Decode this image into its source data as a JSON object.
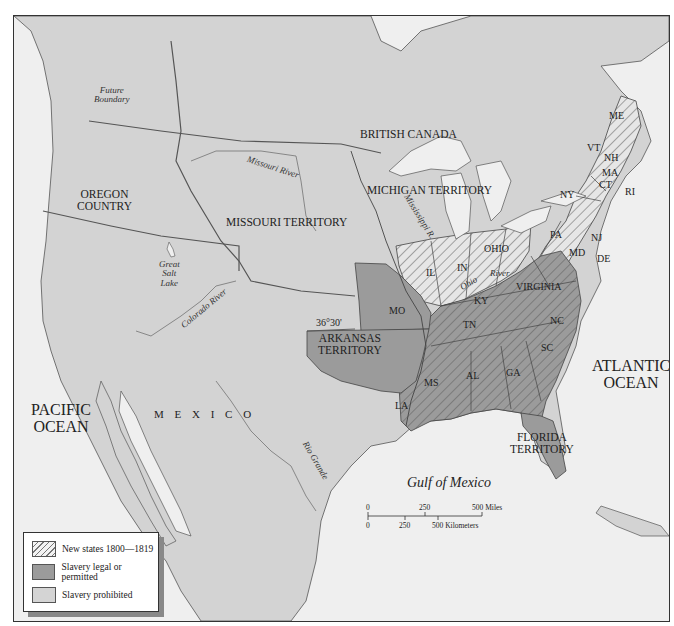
{
  "map": {
    "title": "",
    "colors": {
      "water": "#efefef",
      "land_other": "#d2d2d2",
      "slavery_prohibited": "#d4d4d4",
      "slavery_legal": "#9b9b9b",
      "hatch_line": "#777777",
      "border": "#333333"
    },
    "regions": {
      "british_canada": "BRITISH CANADA",
      "oregon_country": "OREGON COUNTRY",
      "oregon_line1": "OREGON",
      "oregon_line2": "COUNTRY",
      "missouri_territory": "MISSOURI TERRITORY",
      "michigan_territory": "MICHIGAN TERRITORY",
      "arkansas_line1": "ARKANSAS",
      "arkansas_line2": "TERRITORY",
      "florida_line1": "FLORIDA",
      "florida_line2": "TERRITORY",
      "mexico": "M E X I C O",
      "pacific_line1": "PACIFIC",
      "pacific_line2": "OCEAN",
      "atlantic_line1": "ATLANTIC",
      "atlantic_line2": "OCEAN",
      "gulf": "Gulf of Mexico"
    },
    "states": {
      "ME": "ME",
      "VT": "VT",
      "NH": "NH",
      "MA": "MA",
      "CT": "CT",
      "RI": "RI",
      "NY": "NY",
      "PA": "PA",
      "NJ": "NJ",
      "DE": "DE",
      "MD": "MD",
      "OHIO": "OHIO",
      "IN": "IN",
      "IL": "IL",
      "KY": "KY",
      "VIRGINIA": "VIRGINIA",
      "NC": "NC",
      "SC": "SC",
      "TN": "TN",
      "GA": "GA",
      "AL": "AL",
      "MS": "MS",
      "LA": "LA",
      "MO": "MO"
    },
    "features": {
      "future_boundary_line1": "Future",
      "future_boundary_line2": "Boundary",
      "missouri_river": "Missouri River",
      "mississippi_river": "Mississippi R.",
      "ohio_river_1": "Ohio",
      "ohio_river_2": "River",
      "great_salt_lake_1": "Great",
      "great_salt_lake_2": "Salt",
      "great_salt_lake_3": "Lake",
      "colorado_river": "Colorado River",
      "rio_grande": "Rio Grande",
      "parallel": "36°30'"
    },
    "legend": {
      "items": [
        {
          "label": "New states 1800—1819",
          "swatch": "hatched"
        },
        {
          "label": "Slavery legal or permitted",
          "swatch": "dark-gray"
        },
        {
          "label": "Slavery prohibited",
          "swatch": "light-gray"
        }
      ]
    },
    "scale_bar": {
      "miles_ticks": [
        "0",
        "250",
        "500 Miles"
      ],
      "km_ticks": [
        "0",
        "250",
        "500 Kilometers"
      ]
    }
  }
}
